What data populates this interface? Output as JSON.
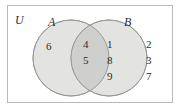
{
  "figure": {
    "type": "venn-diagram",
    "universe_label": "U",
    "set_a_label": "A",
    "set_b_label": "B",
    "colors": {
      "frame_border": "#b9b9b7",
      "circle_fill": "#e3e3e1",
      "intersection_fill": "#cfcfcd",
      "circle_stroke": "#9a9a98",
      "text": "#2b2b2b",
      "background": "#ffffff"
    },
    "regions": {
      "a_only": [
        "6"
      ],
      "intersection": [
        "4",
        "5"
      ],
      "b_only": [
        "1",
        "8",
        "9"
      ],
      "outside": [
        "2",
        "3",
        "7"
      ]
    }
  }
}
